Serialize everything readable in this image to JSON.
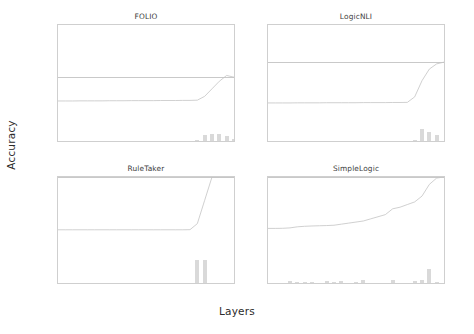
{
  "figure": {
    "xlabel": "Layers",
    "ylabel": "Accuracy"
  },
  "chart_data": {
    "type": "line",
    "title": "",
    "xlabel": "Layers",
    "ylabel": "Accuracy",
    "xlim": [
      0,
      24
    ],
    "ylim": [
      0,
      100
    ],
    "grid": false,
    "legend": "none",
    "xticks": [
      "0",
      "1",
      "2",
      "3",
      "4",
      "5",
      "6",
      "7",
      "8",
      "9",
      "10",
      "11",
      "12",
      "13",
      "14",
      "15",
      "16",
      "17",
      "18",
      "19",
      "20",
      "21",
      "22",
      "23",
      "24"
    ],
    "yticks": [
      "0.0",
      "20.0",
      "40.0",
      "60.0",
      "80.0",
      "100.0"
    ],
    "ytick_values": [
      0,
      20,
      40,
      60,
      80,
      100
    ],
    "panels": [
      {
        "title": "FOLIO",
        "show_ytick_labels": true,
        "show_xtick_labels": false,
        "reference_line": 55.0,
        "x": [
          0,
          1,
          2,
          3,
          4,
          5,
          6,
          7,
          8,
          9,
          10,
          11,
          12,
          13,
          14,
          15,
          16,
          17,
          18,
          19,
          20,
          21,
          22,
          23,
          24
        ],
        "line_values": [
          34.5,
          34.5,
          34.5,
          34.6,
          34.6,
          34.6,
          34.6,
          34.7,
          34.7,
          34.7,
          34.8,
          34.8,
          34.8,
          34.8,
          34.9,
          34.9,
          34.9,
          35.0,
          35.0,
          35.2,
          38.5,
          45.0,
          51.5,
          56.5,
          55.0
        ],
        "bars": {
          "x": [
            19,
            20,
            21,
            22,
            23,
            24
          ],
          "values": [
            1.2,
            5.5,
            6.0,
            5.8,
            4.0,
            1.5
          ]
        }
      },
      {
        "title": "LogicNLI",
        "show_ytick_labels": false,
        "show_xtick_labels": false,
        "reference_line": 68.0,
        "x": [
          0,
          1,
          2,
          3,
          4,
          5,
          6,
          7,
          8,
          9,
          10,
          11,
          12,
          13,
          14,
          15,
          16,
          17,
          18,
          19,
          20,
          21,
          22,
          23,
          24
        ],
        "line_values": [
          32.8,
          32.8,
          32.8,
          32.8,
          32.9,
          32.9,
          32.9,
          32.9,
          33.0,
          33.0,
          33.0,
          33.0,
          33.0,
          33.1,
          33.1,
          33.1,
          33.1,
          33.2,
          33.2,
          33.3,
          38.0,
          52.0,
          62.0,
          66.5,
          68.0
        ],
        "bars": {
          "x": [
            20,
            21,
            22,
            23
          ],
          "values": [
            1.0,
            10.5,
            7.5,
            5.5
          ]
        }
      },
      {
        "title": "RuleTaker",
        "show_ytick_labels": true,
        "show_xtick_labels": true,
        "reference_line": 100.0,
        "x": [
          0,
          1,
          2,
          3,
          4,
          5,
          6,
          7,
          8,
          9,
          10,
          11,
          12,
          13,
          14,
          15,
          16,
          17,
          18,
          19,
          20,
          21,
          22,
          23,
          24
        ],
        "line_values": [
          50.2,
          50.2,
          50.2,
          50.2,
          50.2,
          50.2,
          50.2,
          50.2,
          50.2,
          50.2,
          50.2,
          50.2,
          50.2,
          50.2,
          50.2,
          50.2,
          50.2,
          50.2,
          50.3,
          56.0,
          78.0,
          100.0,
          100.0,
          100.0,
          100.0
        ],
        "bars": {
          "x": [
            19,
            20
          ],
          "values": [
            22.0,
            22.0
          ]
        }
      },
      {
        "title": "SimpleLogic",
        "show_ytick_labels": false,
        "show_xtick_labels": true,
        "reference_line": 100.0,
        "x": [
          0,
          1,
          2,
          3,
          4,
          5,
          6,
          7,
          8,
          9,
          10,
          11,
          12,
          13,
          14,
          15,
          16,
          17,
          18,
          19,
          20,
          21,
          22,
          23,
          24
        ],
        "line_values": [
          51.5,
          51.5,
          51.6,
          52.0,
          53.0,
          53.5,
          53.8,
          54.0,
          54.2,
          54.5,
          55.5,
          56.5,
          57.5,
          58.5,
          60.5,
          62.5,
          64.5,
          70.0,
          71.5,
          74.0,
          76.5,
          82.0,
          93.0,
          99.0,
          100.0
        ],
        "bars": {
          "x": [
            3,
            4,
            5,
            6,
            8,
            9,
            10,
            12,
            13,
            17,
            20,
            21,
            22,
            23
          ],
          "values": [
            2.0,
            1.0,
            0.8,
            0.6,
            1.8,
            1.4,
            1.6,
            0.9,
            2.4,
            3.0,
            2.2,
            2.4,
            13.0,
            1.2
          ]
        }
      }
    ]
  }
}
